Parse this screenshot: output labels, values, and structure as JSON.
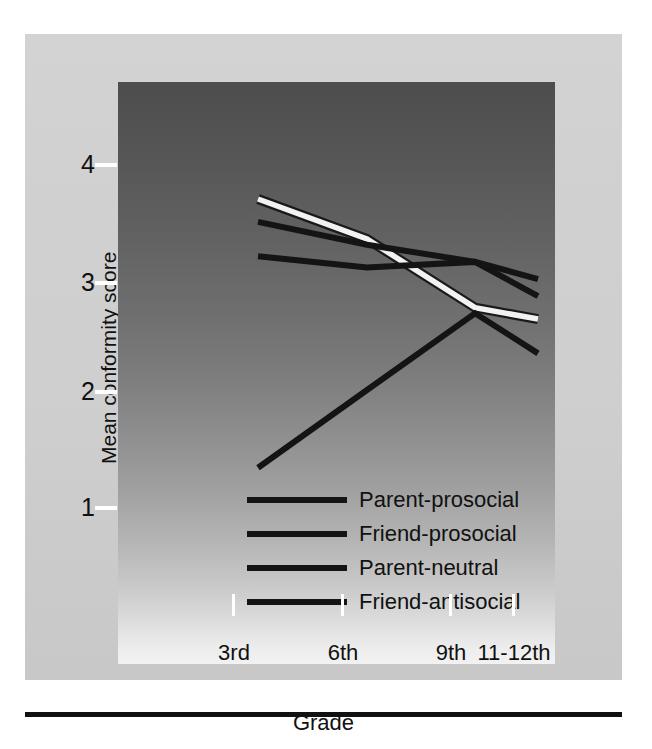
{
  "chart_data": {
    "type": "line",
    "title": "",
    "subtitle": "",
    "xlabel": "Grade",
    "ylabel": "Mean conformity score",
    "categories": [
      "3rd",
      "6th",
      "9th",
      "11-12th"
    ],
    "xtick_labels": [
      "3rd",
      "6th",
      "9th",
      "11-12th"
    ],
    "ytick_labels": [
      "1",
      "2",
      "3",
      "4"
    ],
    "ytick_values": [
      1,
      2,
      3,
      4
    ],
    "ylim": [
      0.55,
      4.6
    ],
    "xlim": [
      0,
      3
    ],
    "grid": false,
    "legend_position": "inside-bottom-center",
    "series": [
      {
        "name": "Parent-prosocial",
        "color": "#f2f2f2",
        "values": [
          4.0,
          3.65,
          3.05,
          2.95
        ]
      },
      {
        "name": "Friend-prosocial",
        "color": "#141414",
        "values": [
          3.8,
          3.6,
          3.45,
          3.15
        ]
      },
      {
        "name": "Parent-neutral",
        "color": "#141414",
        "values": [
          3.5,
          3.4,
          3.45,
          3.3
        ]
      },
      {
        "name": "Friend-antisocial",
        "color": "#141414",
        "values": [
          1.65,
          2.33,
          3.0,
          2.65
        ]
      }
    ],
    "legend": [
      {
        "label": "Parent-prosocial",
        "color": "#141414"
      },
      {
        "label": "Friend-prosocial",
        "color": "#141414"
      },
      {
        "label": "Parent-neutral",
        "color": "#141414"
      },
      {
        "label": "Friend-antisocial",
        "color": "#141414"
      }
    ],
    "colors": {
      "plot_background_top": "#4d4d4d",
      "plot_background_bottom": "#f2f2f2",
      "panel_background": "#d0d0d0",
      "tick_color": "#ffffff",
      "text_color": "#111111",
      "highlight_line": "#f2f2f2"
    }
  }
}
